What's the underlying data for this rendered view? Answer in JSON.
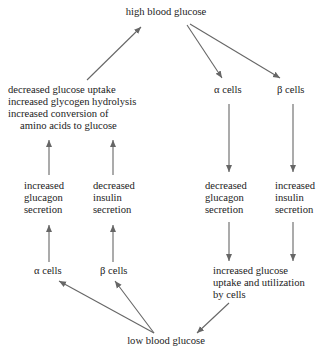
{
  "diagram": {
    "colors": {
      "text": "#222222",
      "arrow": "#666666",
      "background": "#ffffff"
    },
    "nodes": {
      "high_glucose": "high blood glucose",
      "low_glucose": "low blood glucose",
      "alpha_top": "α cells",
      "beta_top": "β cells",
      "alpha_bottom": "α cells",
      "beta_bottom": "β cells",
      "effects_left": [
        "decreased glucose uptake",
        "increased glycogen hydrolysis",
        "increased conversion of",
        "amino acids to glucose"
      ],
      "inc_glucagon": [
        "increased",
        "glucagon",
        "secretion"
      ],
      "dec_insulin": [
        "decreased",
        "insulin",
        "secretion"
      ],
      "dec_glucagon": [
        "decreased",
        "glucagon",
        "secretion"
      ],
      "inc_insulin": [
        "increased",
        "insulin",
        "secretion"
      ],
      "uptake_right": [
        "increased glucose",
        "uptake and utilization",
        "by cells"
      ]
    },
    "edges": [
      {
        "from": "high_glucose",
        "to": "alpha_top"
      },
      {
        "from": "high_glucose",
        "to": "beta_top"
      },
      {
        "from": "alpha_top",
        "to": "dec_glucagon"
      },
      {
        "from": "beta_top",
        "to": "inc_insulin"
      },
      {
        "from": "dec_glucagon",
        "to": "uptake_right"
      },
      {
        "from": "inc_insulin",
        "to": "uptake_right"
      },
      {
        "from": "uptake_right",
        "to": "low_glucose"
      },
      {
        "from": "low_glucose",
        "to": "alpha_bottom"
      },
      {
        "from": "low_glucose",
        "to": "beta_bottom"
      },
      {
        "from": "alpha_bottom",
        "to": "inc_glucagon"
      },
      {
        "from": "beta_bottom",
        "to": "dec_insulin"
      },
      {
        "from": "inc_glucagon",
        "to": "effects_left"
      },
      {
        "from": "dec_insulin",
        "to": "effects_left"
      },
      {
        "from": "effects_left",
        "to": "high_glucose"
      }
    ]
  }
}
